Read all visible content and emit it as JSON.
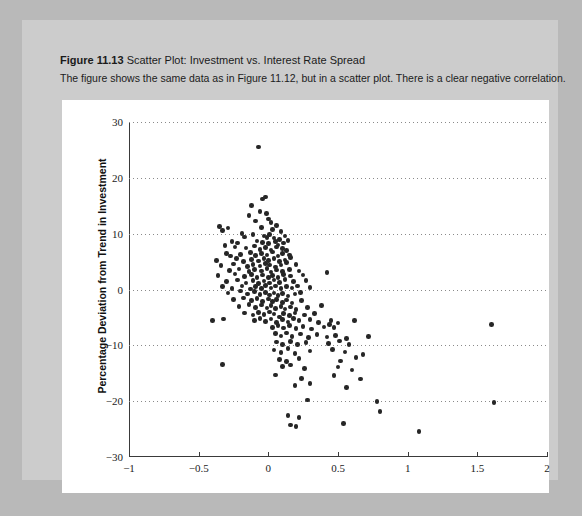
{
  "figure": {
    "number": "Figure 11.13",
    "title": "Scatter Plot: Investment vs. Interest Rate Spread",
    "description": "The figure shows the same data as in Figure 11.12, but in a scatter plot. There is a clear negative correlation."
  },
  "colors": {
    "page_background": "#b9b9b9",
    "card_background": "#cccccc",
    "panel_background": "#ffffff",
    "marker": "#262626",
    "gridline": "#8a8a8a",
    "axis": "#3a3a3a"
  },
  "chart_data": {
    "type": "scatter",
    "title": "Scatter Plot: Investment vs. Interest Rate Spread",
    "xlabel": "Deviation from Trend in Interest Rate Spread",
    "ylabel": "Percentage Deviation from Trend in Investment",
    "xlim": [
      -1,
      2
    ],
    "ylim": [
      -30,
      30
    ],
    "xticks": [
      -1,
      -0.5,
      0,
      0.5,
      1,
      1.5,
      2
    ],
    "xtick_labels": [
      "-1",
      "-0.5",
      "0",
      "0.5",
      "1",
      "1.5",
      "2"
    ],
    "yticks": [
      -30,
      -20,
      -10,
      0,
      10,
      20,
      30
    ],
    "ytick_labels": [
      "-30",
      "-20",
      "-10",
      "0",
      "10",
      "20",
      "30"
    ],
    "grid": "horizontal-dotted",
    "legend": null,
    "marker_size_px": 4.6,
    "correlation": "negative",
    "points": [
      [
        -0.07,
        25.5
      ],
      [
        -0.04,
        16.2
      ],
      [
        -0.02,
        16.6
      ],
      [
        -0.12,
        15.0
      ],
      [
        -0.06,
        14.0
      ],
      [
        -0.14,
        13.3
      ],
      [
        -0.015,
        13.6
      ],
      [
        0.0,
        12.6
      ],
      [
        -0.09,
        12.3
      ],
      [
        0.02,
        12.0
      ],
      [
        -0.35,
        11.3
      ],
      [
        -0.33,
        10.6
      ],
      [
        -0.29,
        11.0
      ],
      [
        -0.05,
        11.1
      ],
      [
        0.03,
        10.7
      ],
      [
        0.06,
        11.5
      ],
      [
        0.09,
        10.4
      ],
      [
        -0.19,
        10.0
      ],
      [
        -0.17,
        9.4
      ],
      [
        -0.11,
        9.8
      ],
      [
        -0.03,
        9.6
      ],
      [
        -0.01,
        9.3
      ],
      [
        0.01,
        9.9
      ],
      [
        0.04,
        9.2
      ],
      [
        0.08,
        9.0
      ],
      [
        0.12,
        9.6
      ],
      [
        -0.26,
        8.6
      ],
      [
        -0.22,
        8.3
      ],
      [
        -0.08,
        8.7
      ],
      [
        -0.04,
        8.4
      ],
      [
        0.0,
        8.2
      ],
      [
        0.05,
        8.6
      ],
      [
        0.07,
        8.0
      ],
      [
        0.11,
        8.3
      ],
      [
        0.14,
        8.8
      ],
      [
        -0.31,
        7.9
      ],
      [
        -0.24,
        7.6
      ],
      [
        -0.16,
        7.4
      ],
      [
        -0.1,
        7.8
      ],
      [
        -0.06,
        7.2
      ],
      [
        -0.02,
        7.5
      ],
      [
        0.02,
        7.1
      ],
      [
        0.06,
        7.6
      ],
      [
        0.1,
        7.3
      ],
      [
        0.13,
        7.0
      ],
      [
        -0.3,
        6.4
      ],
      [
        -0.27,
        6.0
      ],
      [
        -0.2,
        6.3
      ],
      [
        -0.13,
        6.6
      ],
      [
        -0.09,
        6.1
      ],
      [
        -0.05,
        6.5
      ],
      [
        -0.01,
        6.2
      ],
      [
        0.03,
        6.7
      ],
      [
        0.07,
        6.0
      ],
      [
        0.1,
        6.4
      ],
      [
        0.15,
        6.2
      ],
      [
        -0.37,
        5.2
      ],
      [
        -0.23,
        5.5
      ],
      [
        -0.18,
        5.0
      ],
      [
        -0.12,
        5.4
      ],
      [
        -0.07,
        5.1
      ],
      [
        -0.03,
        5.6
      ],
      [
        0.0,
        5.2
      ],
      [
        0.04,
        5.5
      ],
      [
        0.08,
        5.0
      ],
      [
        0.12,
        5.3
      ],
      [
        0.16,
        5.7
      ],
      [
        -0.34,
        4.3
      ],
      [
        -0.25,
        4.6
      ],
      [
        -0.15,
        4.1
      ],
      [
        -0.11,
        4.5
      ],
      [
        -0.06,
        4.2
      ],
      [
        -0.02,
        4.7
      ],
      [
        0.01,
        4.4
      ],
      [
        0.05,
        4.0
      ],
      [
        0.09,
        4.4
      ],
      [
        0.13,
        4.8
      ],
      [
        0.2,
        4.5
      ],
      [
        -0.28,
        3.4
      ],
      [
        -0.21,
        3.7
      ],
      [
        -0.14,
        3.2
      ],
      [
        -0.1,
        3.6
      ],
      [
        -0.05,
        3.3
      ],
      [
        -0.01,
        3.8
      ],
      [
        0.02,
        3.1
      ],
      [
        0.06,
        3.5
      ],
      [
        0.1,
        3.2
      ],
      [
        0.15,
        3.6
      ],
      [
        0.22,
        3.3
      ],
      [
        -0.36,
        2.5
      ],
      [
        -0.24,
        2.8
      ],
      [
        -0.17,
        2.3
      ],
      [
        -0.12,
        2.7
      ],
      [
        -0.08,
        2.2
      ],
      [
        -0.04,
        2.6
      ],
      [
        0.0,
        2.1
      ],
      [
        0.03,
        2.5
      ],
      [
        0.07,
        2.2
      ],
      [
        0.11,
        2.7
      ],
      [
        0.16,
        2.4
      ],
      [
        0.25,
        2.6
      ],
      [
        0.42,
        3.0
      ],
      [
        -0.3,
        1.4
      ],
      [
        -0.22,
        1.7
      ],
      [
        -0.16,
        1.2
      ],
      [
        -0.11,
        1.6
      ],
      [
        -0.07,
        1.1
      ],
      [
        -0.03,
        1.5
      ],
      [
        0.01,
        1.2
      ],
      [
        0.04,
        1.7
      ],
      [
        0.08,
        1.3
      ],
      [
        0.12,
        1.8
      ],
      [
        0.18,
        1.4
      ],
      [
        0.27,
        1.6
      ],
      [
        -0.33,
        0.5
      ],
      [
        -0.26,
        0.2
      ],
      [
        -0.19,
        0.6
      ],
      [
        -0.13,
        0.1
      ],
      [
        -0.09,
        0.5
      ],
      [
        -0.05,
        0.2
      ],
      [
        -0.02,
        0.7
      ],
      [
        0.02,
        0.3
      ],
      [
        0.05,
        0.6
      ],
      [
        0.09,
        0.2
      ],
      [
        0.13,
        0.5
      ],
      [
        0.17,
        0.3
      ],
      [
        0.21,
        0.6
      ],
      [
        0.3,
        0.4
      ],
      [
        -0.29,
        -0.6
      ],
      [
        -0.2,
        -0.3
      ],
      [
        -0.15,
        -0.8
      ],
      [
        -0.1,
        -0.4
      ],
      [
        -0.06,
        -0.9
      ],
      [
        -0.02,
        -0.5
      ],
      [
        0.01,
        -1.0
      ],
      [
        0.04,
        -0.6
      ],
      [
        0.07,
        -1.1
      ],
      [
        0.1,
        -0.7
      ],
      [
        0.14,
        -1.2
      ],
      [
        0.19,
        -0.8
      ],
      [
        0.23,
        -0.5
      ],
      [
        -0.25,
        -1.8
      ],
      [
        -0.18,
        -1.5
      ],
      [
        -0.12,
        -2.0
      ],
      [
        -0.08,
        -1.6
      ],
      [
        -0.04,
        -2.1
      ],
      [
        0.0,
        -1.7
      ],
      [
        0.03,
        -2.2
      ],
      [
        0.06,
        -1.8
      ],
      [
        0.1,
        -2.3
      ],
      [
        0.13,
        -1.9
      ],
      [
        0.17,
        -2.4
      ],
      [
        0.24,
        -2.0
      ],
      [
        -0.21,
        -3.0
      ],
      [
        -0.14,
        -2.7
      ],
      [
        -0.09,
        -3.2
      ],
      [
        -0.05,
        -2.8
      ],
      [
        -0.01,
        -3.3
      ],
      [
        0.02,
        -2.9
      ],
      [
        0.05,
        -3.4
      ],
      [
        0.09,
        -3.0
      ],
      [
        0.12,
        -3.5
      ],
      [
        0.16,
        -3.1
      ],
      [
        0.2,
        -3.6
      ],
      [
        0.28,
        -3.2
      ],
      [
        0.38,
        -2.9
      ],
      [
        -0.17,
        -4.2
      ],
      [
        -0.11,
        -4.6
      ],
      [
        -0.07,
        -4.1
      ],
      [
        -0.03,
        -4.5
      ],
      [
        0.01,
        -4.0
      ],
      [
        0.04,
        -4.4
      ],
      [
        0.08,
        -4.9
      ],
      [
        0.11,
        -4.3
      ],
      [
        0.15,
        -4.7
      ],
      [
        0.19,
        -4.2
      ],
      [
        0.26,
        -4.6
      ],
      [
        0.33,
        -4.3
      ],
      [
        -0.4,
        -5.5
      ],
      [
        -0.32,
        -5.3
      ],
      [
        -0.1,
        -5.6
      ],
      [
        -0.06,
        -5.2
      ],
      [
        -0.02,
        -5.7
      ],
      [
        0.02,
        -5.3
      ],
      [
        0.06,
        -5.9
      ],
      [
        0.1,
        -5.4
      ],
      [
        0.14,
        -5.8
      ],
      [
        0.18,
        -5.2
      ],
      [
        0.22,
        -5.6
      ],
      [
        0.3,
        -5.4
      ],
      [
        0.36,
        -5.9
      ],
      [
        0.45,
        -5.5
      ],
      [
        0.5,
        -6.0
      ],
      [
        0.62,
        -5.6
      ],
      [
        0.03,
        -6.8
      ],
      [
        0.07,
        -6.4
      ],
      [
        0.11,
        -6.9
      ],
      [
        0.15,
        -6.5
      ],
      [
        0.2,
        -7.0
      ],
      [
        0.25,
        -6.6
      ],
      [
        0.31,
        -7.1
      ],
      [
        0.4,
        -6.7
      ],
      [
        0.44,
        -6.3
      ],
      [
        0.47,
        -6.8
      ],
      [
        0.05,
        -7.9
      ],
      [
        0.09,
        -8.3
      ],
      [
        0.13,
        -7.8
      ],
      [
        0.17,
        -8.4
      ],
      [
        0.23,
        -8.0
      ],
      [
        0.29,
        -8.6
      ],
      [
        0.35,
        -8.1
      ],
      [
        0.42,
        -8.5
      ],
      [
        0.48,
        -8.2
      ],
      [
        0.56,
        -8.8
      ],
      [
        0.72,
        -8.4
      ],
      [
        0.06,
        -9.4
      ],
      [
        0.1,
        -9.8
      ],
      [
        0.16,
        -9.3
      ],
      [
        0.21,
        -9.9
      ],
      [
        0.27,
        -9.5
      ],
      [
        0.43,
        -9.7
      ],
      [
        0.51,
        -9.2
      ],
      [
        0.58,
        -9.9
      ],
      [
        1.6,
        -6.3
      ],
      [
        0.04,
        -10.8
      ],
      [
        0.09,
        -11.3
      ],
      [
        0.14,
        -10.6
      ],
      [
        0.19,
        -11.5
      ],
      [
        0.3,
        -11.0
      ],
      [
        0.46,
        -10.7
      ],
      [
        0.55,
        -11.2
      ],
      [
        0.68,
        -11.6
      ],
      [
        0.08,
        -12.5
      ],
      [
        0.13,
        -12.9
      ],
      [
        0.22,
        -12.4
      ],
      [
        0.52,
        -12.8
      ],
      [
        0.63,
        -12.2
      ],
      [
        -0.33,
        -13.4
      ],
      [
        0.1,
        -13.8
      ],
      [
        0.16,
        -13.5
      ],
      [
        0.26,
        -14.2
      ],
      [
        0.5,
        -13.9
      ],
      [
        0.6,
        -14.4
      ],
      [
        0.05,
        -15.3
      ],
      [
        0.24,
        -15.9
      ],
      [
        0.47,
        -15.4
      ],
      [
        0.66,
        -16.0
      ],
      [
        0.19,
        -17.2
      ],
      [
        0.3,
        -16.8
      ],
      [
        0.56,
        -17.5
      ],
      [
        0.28,
        -19.8
      ],
      [
        0.78,
        -20.1
      ],
      [
        1.62,
        -20.2
      ],
      [
        0.14,
        -22.6
      ],
      [
        0.22,
        -22.9
      ],
      [
        0.8,
        -21.8
      ],
      [
        0.16,
        -24.3
      ],
      [
        0.2,
        -24.5
      ],
      [
        0.54,
        -24.0
      ],
      [
        1.08,
        -25.4
      ]
    ]
  }
}
